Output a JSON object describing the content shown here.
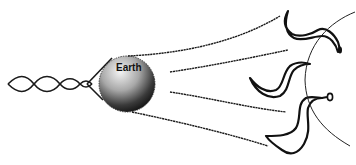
{
  "diagram": {
    "earth_label": "Earth",
    "colors": {
      "line": "#1a1a1a",
      "earth_light": "#f2f2f2",
      "earth_dark": "#1e1e1e",
      "background": "#ffffff"
    },
    "elements": [
      "twisted-tail",
      "earth-sphere",
      "field-lines",
      "plasma-structures",
      "arc-boundary"
    ]
  }
}
